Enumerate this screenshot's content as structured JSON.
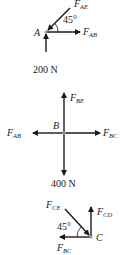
{
  "diagram": {
    "type": "free-body-diagrams",
    "colors": {
      "ink": "#1a1a1a",
      "node": "#9a9a9a"
    },
    "joints": [
      {
        "name": "A",
        "forces": [
          {
            "label_main": "F",
            "label_sub": "AE",
            "direction": "down-left into joint at 45°"
          },
          {
            "label_main": "F",
            "label_sub": "AB",
            "direction": "right"
          },
          {
            "label_main": "200 N",
            "label_sub": "",
            "direction": "up"
          }
        ],
        "angle": "45°"
      },
      {
        "name": "B",
        "forces": [
          {
            "label_main": "F",
            "label_sub": "BE",
            "direction": "up"
          },
          {
            "label_main": "F",
            "label_sub": "AB",
            "direction": "left"
          },
          {
            "label_main": "F",
            "label_sub": "BC",
            "direction": "right"
          },
          {
            "label_main": "400 N",
            "label_sub": "",
            "direction": "down"
          }
        ]
      },
      {
        "name": "C",
        "forces": [
          {
            "label_main": "F",
            "label_sub": "CE",
            "direction": "down-right into joint at 45°"
          },
          {
            "label_main": "F",
            "label_sub": "CD",
            "direction": "up"
          },
          {
            "label_main": "F",
            "label_sub": "BC",
            "direction": "left"
          }
        ],
        "angle": "45°"
      }
    ]
  }
}
